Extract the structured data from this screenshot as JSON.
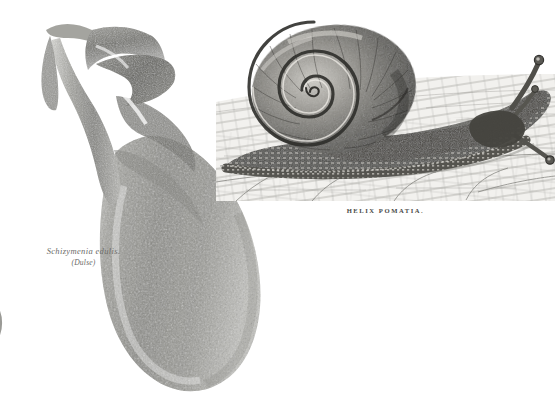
{
  "plate": {
    "background_color": "#ffffff",
    "ink_color": "#4a4a47",
    "figure_count": 2
  },
  "seaweed_figure": {
    "name": "seaweed-illustration",
    "caption_scientific": "Schizymenia edulis.",
    "caption_common": "(Dulse)",
    "caption_color": "#6b6b68",
    "tone_color": "#8e8e8a",
    "description_parts": [
      "stipe",
      "upper-blades",
      "main-blade"
    ]
  },
  "snail_figure": {
    "name": "snail-engraving",
    "caption": "HELIX POMATIA.",
    "caption_color": "#4a4a47",
    "panel_color": "#f4f3f0",
    "parts": [
      "shell",
      "spiral",
      "body",
      "foot",
      "tentacles",
      "ground"
    ]
  },
  "corner_fragment": {
    "name": "cropped-circular-specimen",
    "tone_color": "#9a9a96"
  }
}
